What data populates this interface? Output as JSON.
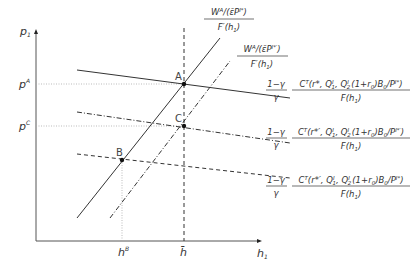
{
  "diagram": {
    "type": "economic-equilibrium-diagram",
    "axes": {
      "y_label": "p",
      "y_label_sub": "1",
      "x_label": "h",
      "x_label_sub": "1"
    },
    "y_ticks": [
      {
        "base": "p",
        "sup": "A"
      },
      {
        "base": "p",
        "sup": "C"
      }
    ],
    "x_ticks": [
      {
        "base": "h",
        "sup": "B"
      },
      {
        "base": "h̄",
        "sup": ""
      }
    ],
    "points": [
      {
        "label": "A"
      },
      {
        "label": "B"
      },
      {
        "label": "C"
      }
    ],
    "curves": {
      "supply_solid": {
        "numerator": "W",
        "numerator_sup": "A",
        "numerator_rest": "/(ε̄P",
        "numerator_rest_sup": "I*",
        "numerator_close": ")",
        "denominator": "F′(h",
        "denominator_sub": "1",
        "denominator_close": ")",
        "style": "solid"
      },
      "supply_dashdot": {
        "numerator": "W",
        "numerator_sup": "A",
        "numerator_rest": "/(ε̄P",
        "numerator_rest_sup": "I*′",
        "numerator_close": ")",
        "denominator": "F′(h",
        "denominator_sub": "1",
        "denominator_close": ")",
        "style": "dash-dot"
      },
      "demand_solid": {
        "coef_num": "1−γ",
        "coef_den": "γ",
        "numerator": "C",
        "numerator_sup": "T",
        "numerator_args": "(r*, Q",
        "q1_sup": "I",
        "q1_sub": "1",
        "mid": ", Q",
        "q2_sup": "I",
        "q2_sub": "2",
        "tail": "(1+r",
        "r_sub": "0",
        "tail2": ")B",
        "b_sub": "0",
        "tail3": "/P",
        "p_sup": "I*",
        "close": ")",
        "denominator": "F(h",
        "denominator_sub": "1",
        "denominator_close": ")",
        "style": "solid"
      },
      "demand_dashdot": {
        "coef_num": "1−γ",
        "coef_den": "γ",
        "numerator": "C",
        "numerator_sup": "T",
        "numerator_args": "(r*′, Q",
        "q1_sup": "I",
        "q1_sub": "1",
        "mid": ", Q",
        "q2_sup": "I",
        "q2_sub": "2",
        "tail": "(1+r",
        "r_sub": "0",
        "tail2": ")B",
        "b_sub": "0",
        "tail3": "/P",
        "p_sup": "I*′",
        "close": ")",
        "denominator": "F(h",
        "denominator_sub": "1",
        "denominator_close": ")",
        "style": "dash-dot"
      },
      "demand_dashed": {
        "coef_num": "1−γ",
        "coef_den": "γ",
        "numerator": "C",
        "numerator_sup": "T",
        "numerator_args": "(r*′, Q",
        "q1_sup": "I",
        "q1_sub": "1",
        "mid": ", Q",
        "q2_sup": "I",
        "q2_sub": "2",
        "tail": "(1+r",
        "r_sub": "0",
        "tail2": ")B",
        "b_sub": "0",
        "tail3": "/P",
        "p_sup": "I*",
        "close": ")",
        "denominator": "F(h",
        "denominator_sub": "1",
        "denominator_close": ")",
        "style": "dashed"
      }
    },
    "colors": {
      "line": "#333333",
      "axis": "#555555",
      "guide": "#999999"
    }
  }
}
